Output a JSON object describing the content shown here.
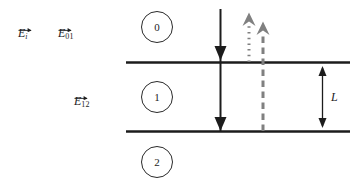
{
  "figure": {
    "background_color": "#ffffff",
    "ink_color": "#1c1c1c",
    "gray_color": "#808080"
  },
  "labels": {
    "incident_field": {
      "symbol": "E",
      "subscript": "i",
      "vector": true
    },
    "field_01": {
      "symbol": "E",
      "subscript": "01",
      "vector": true
    },
    "field_12": {
      "symbol": "E",
      "subscript": "12",
      "vector": true
    }
  },
  "regions": [
    {
      "id": "region-0",
      "number": "0"
    },
    {
      "id": "region-1",
      "number": "1"
    },
    {
      "id": "region-2",
      "number": "2"
    }
  ],
  "interfaces": [
    {
      "id": "interface-top",
      "y": 62
    },
    {
      "id": "interface-bottom",
      "y": 131
    }
  ],
  "arrows": [
    {
      "id": "incident-arrow",
      "direction": "down",
      "style": "solid",
      "color": "#1c1c1c"
    },
    {
      "id": "reflected-arrow-01",
      "direction": "up",
      "style": "dotted",
      "color": "#808080"
    },
    {
      "id": "reflected-arrow-12",
      "direction": "up",
      "style": "dashed",
      "color": "#808080"
    }
  ],
  "dimension": {
    "label": "L",
    "id": "thickness-dimension"
  }
}
